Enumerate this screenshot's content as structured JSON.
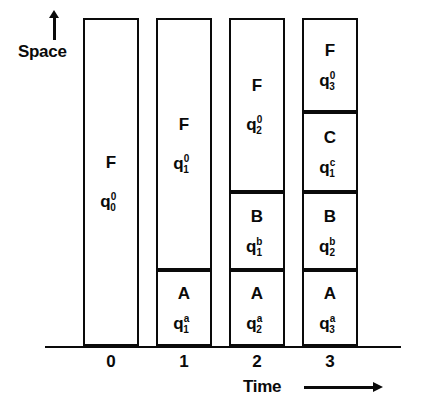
{
  "axes": {
    "y_label": "Space",
    "y_arrow_icon": "arrow-up-icon",
    "x_label": "Time",
    "x_arrow_icon": "arrow-right-icon",
    "x_tick_labels": [
      "0",
      "1",
      "2",
      "3"
    ]
  },
  "chart_data": {
    "type": "bar",
    "title": "",
    "xlabel": "Time",
    "ylabel": "Space",
    "grid": false,
    "legend": null,
    "categories": [
      "0",
      "1",
      "2",
      "3"
    ],
    "columns": [
      {
        "time": "0",
        "x_px": 83,
        "width_px": 56,
        "cells": [
          {
            "symbol": "F",
            "state_base": "q",
            "state_sup": "0",
            "state_sub": "0",
            "top_px": 18,
            "height_px": 328
          }
        ]
      },
      {
        "time": "1",
        "x_px": 156,
        "width_px": 56,
        "cells": [
          {
            "symbol": "F",
            "state_base": "q",
            "state_sup": "0",
            "state_sub": "1",
            "top_px": 18,
            "height_px": 252
          },
          {
            "symbol": "A",
            "state_base": "q",
            "state_sup": "a",
            "state_sub": "1",
            "top_px": 270,
            "height_px": 76
          }
        ]
      },
      {
        "time": "2",
        "x_px": 229,
        "width_px": 56,
        "cells": [
          {
            "symbol": "F",
            "state_base": "q",
            "state_sup": "0",
            "state_sub": "2",
            "top_px": 18,
            "height_px": 174
          },
          {
            "symbol": "B",
            "state_base": "q",
            "state_sup": "b",
            "state_sub": "1",
            "top_px": 192,
            "height_px": 78
          },
          {
            "symbol": "A",
            "state_base": "q",
            "state_sup": "a",
            "state_sub": "2",
            "top_px": 270,
            "height_px": 76
          }
        ]
      },
      {
        "time": "3",
        "x_px": 302,
        "width_px": 56,
        "cells": [
          {
            "symbol": "F",
            "state_base": "q",
            "state_sup": "0",
            "state_sub": "3",
            "top_px": 18,
            "height_px": 94
          },
          {
            "symbol": "C",
            "state_base": "q",
            "state_sup": "c",
            "state_sub": "1",
            "top_px": 112,
            "height_px": 80
          },
          {
            "symbol": "B",
            "state_base": "q",
            "state_sup": "b",
            "state_sub": "2",
            "top_px": 192,
            "height_px": 78
          },
          {
            "symbol": "A",
            "state_base": "q",
            "state_sup": "a",
            "state_sub": "3",
            "top_px": 270,
            "height_px": 76
          }
        ]
      }
    ]
  },
  "style": {
    "ink_color": "#0a0a0a",
    "paper_color": "#ffffff"
  }
}
